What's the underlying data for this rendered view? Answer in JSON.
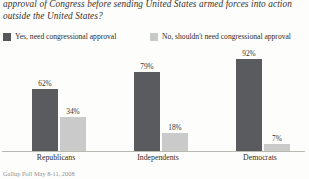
{
  "title": {
    "line1": "approval of Congress before sending United States armed forces into action",
    "line2": "outside the United States?"
  },
  "legend": {
    "items": [
      {
        "label": "Yes, need congressional approval",
        "color": "#55565a",
        "swatch": "dark"
      },
      {
        "label": "No, shouldn't need congressional approval",
        "color": "#c7c8c8",
        "swatch": "light"
      }
    ]
  },
  "source": "Gallup Poll May 8-11, 2008",
  "chart_data": {
    "type": "bar",
    "title": "approval of Congress before sending United States armed forces into action outside the United States?",
    "xlabel": "",
    "ylabel": "",
    "ylim": [
      0,
      100
    ],
    "grid": false,
    "legend_position": "top",
    "categories": [
      "Republicans",
      "Independents",
      "Democrats"
    ],
    "series": [
      {
        "name": "Yes, need congressional approval",
        "color": "#5a5b5f",
        "values": [
          62,
          79,
          92
        ],
        "labels": [
          "62%",
          "79%",
          "92%"
        ]
      },
      {
        "name": "No, shouldn't need congressional approval",
        "color": "#c9cac9",
        "values": [
          34,
          18,
          7
        ],
        "labels": [
          "34%",
          "18%",
          "7%"
        ]
      }
    ]
  }
}
